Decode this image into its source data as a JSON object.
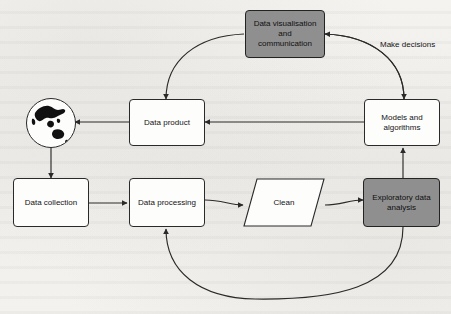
{
  "diagram": {
    "background_color": "#f2f1ee",
    "node_fill_white": "#fdfdfc",
    "node_fill_gray": "#8f8f8f",
    "stroke_color": "#2a2a2a",
    "nodes": [
      {
        "id": "data_visualisation",
        "label": "Data visualisation and communication",
        "line1": "Data visualisation",
        "line2": "and",
        "line3": "communication",
        "shape": "rounded-rectangle",
        "fill": "gray"
      },
      {
        "id": "data_product",
        "label": "Data product",
        "shape": "rounded-rectangle",
        "fill": "white"
      },
      {
        "id": "models_and_algorithms",
        "label": "Models and algorithms",
        "line1": "Models and",
        "line2": "algorithms",
        "shape": "rounded-rectangle",
        "fill": "white"
      },
      {
        "id": "data_collection",
        "label": "Data collection",
        "shape": "rounded-rectangle",
        "fill": "white"
      },
      {
        "id": "data_processing",
        "label": "Data processing",
        "shape": "rounded-rectangle",
        "fill": "white"
      },
      {
        "id": "clean",
        "label": "Clean",
        "shape": "parallelogram",
        "fill": "white"
      },
      {
        "id": "exploratory_data_analysis",
        "label": "Exploratory data analysis",
        "line1": "Exploratory data",
        "line2": "analysis",
        "shape": "rounded-rectangle",
        "fill": "gray"
      },
      {
        "id": "world",
        "label": "",
        "shape": "globe",
        "fill": "white"
      }
    ],
    "edges": [
      {
        "id": "models-to-visualisation",
        "from": "models_and_algorithms",
        "to": "data_visualisation",
        "label": "",
        "style": "curved"
      },
      {
        "id": "visualisation-to-models",
        "from": "data_visualisation",
        "to": "models_and_algorithms",
        "label": "Make decisions",
        "style": "curved"
      },
      {
        "id": "visualisation-to-data-product",
        "from": "data_visualisation",
        "to": "data_product",
        "label": "",
        "style": "curved"
      },
      {
        "id": "models-to-data-product",
        "from": "models_and_algorithms",
        "to": "data_product",
        "label": "",
        "style": "straight"
      },
      {
        "id": "data-product-to-world",
        "from": "data_product",
        "to": "world",
        "label": "",
        "style": "straight"
      },
      {
        "id": "world-to-data-collection",
        "from": "world",
        "to": "data_collection",
        "label": "",
        "style": "straight"
      },
      {
        "id": "data-collection-to-data-processing",
        "from": "data_collection",
        "to": "data_processing",
        "label": "",
        "style": "straight"
      },
      {
        "id": "data-processing-to-clean",
        "from": "data_processing",
        "to": "clean",
        "label": "",
        "style": "curved"
      },
      {
        "id": "clean-to-exploratory",
        "from": "clean",
        "to": "exploratory_data_analysis",
        "label": "",
        "style": "curved"
      },
      {
        "id": "exploratory-to-models",
        "from": "exploratory_data_analysis",
        "to": "models_and_algorithms",
        "label": "",
        "style": "straight"
      },
      {
        "id": "exploratory-to-data-processing",
        "from": "exploratory_data_analysis",
        "to": "data_processing",
        "label": "",
        "style": "curved"
      }
    ],
    "edge_labels": {
      "make_decisions": "Make decisions"
    }
  }
}
